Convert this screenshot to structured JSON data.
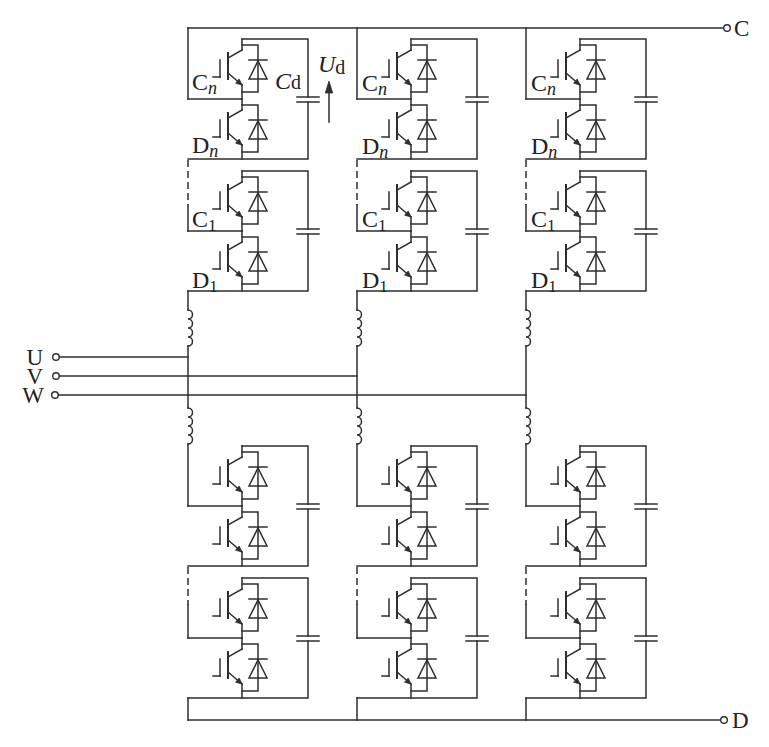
{
  "diagram": {
    "type": "MMC three-phase converter circuit",
    "colors": {
      "line": "#2e2e2e",
      "background": "#ffffff",
      "text": "#222222"
    },
    "terminals": {
      "dc_top": {
        "label": "C"
      },
      "dc_bottom": {
        "label": "D"
      },
      "phases": [
        {
          "label": "U"
        },
        {
          "label": "V"
        },
        {
          "label": "W"
        }
      ]
    },
    "module_labels": {
      "module_n": {
        "upper": {
          "main": "C",
          "sub": "n"
        },
        "lower": {
          "main": "D",
          "sub": "n"
        }
      },
      "module_1": {
        "upper": {
          "main": "C",
          "sub": "1"
        },
        "lower": {
          "main": "D",
          "sub": "1"
        }
      }
    },
    "capacitor_label": {
      "main": "C",
      "sub": "d"
    },
    "voltage_label": {
      "main": "U",
      "sub": "d"
    },
    "structure": {
      "phase_legs": 3,
      "arms_per_leg": 2,
      "submodules_drawn_per_arm": 2,
      "elided_submodules_marker": "dashed line",
      "arm_inductor_per_arm": 1,
      "submodule_components": [
        "IGBT with antiparallel diode (upper)",
        "IGBT with antiparallel diode (lower)",
        "DC capacitor"
      ]
    }
  }
}
